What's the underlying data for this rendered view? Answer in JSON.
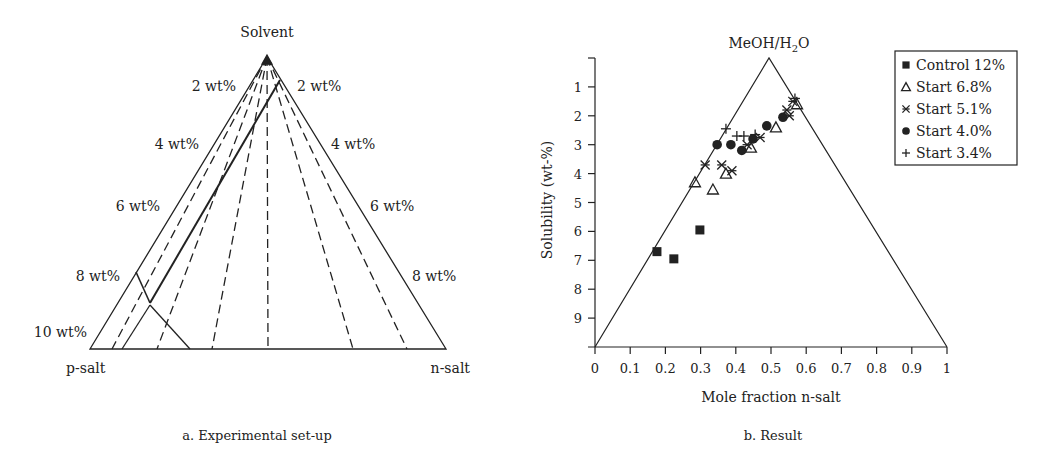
{
  "panel_a": {
    "caption": "a. Experimental set-up",
    "apex_label": "Solvent",
    "left_corner_label": "p-salt",
    "right_corner_label": "n-salt",
    "left_scale_labels": [
      "2 wt%",
      "4 wt%",
      "6 wt%",
      "8 wt%",
      "10 wt%"
    ],
    "right_scale_labels": [
      "2 wt%",
      "4 wt%",
      "6 wt%",
      "8 wt%"
    ]
  },
  "panel_b": {
    "caption": "b. Result",
    "apex_label": "MeOH/H",
    "apex_label_sub": "2",
    "apex_label_tail": "O",
    "xlabel": "Mole fraction n-salt",
    "ylabel": "Solubility (wt-%)",
    "x_ticks": [
      "0",
      "0.1",
      "0.2",
      "0.3",
      "0.4",
      "0.5",
      "0.6",
      "0.7",
      "0.8",
      "0.9",
      "1"
    ],
    "y_ticks": [
      "1",
      "2",
      "3",
      "4",
      "5",
      "6",
      "7",
      "8",
      "9"
    ],
    "legend": [
      {
        "marker": "square",
        "label": "Control 12%"
      },
      {
        "marker": "triangle-open",
        "label": "Start 6.8%"
      },
      {
        "marker": "asterisk",
        "label": "Start 5.1%"
      },
      {
        "marker": "circle",
        "label": "Start 4.0%"
      },
      {
        "marker": "plus",
        "label": "Start 3.4%"
      }
    ]
  },
  "chart_data": [
    {
      "type": "diagram",
      "title": "a. Experimental set-up",
      "description": "Ternary diagram Solvent / p-salt / n-salt with dashed tie lines from Solvent apex and solid operating path",
      "vertices": [
        "Solvent",
        "p-salt",
        "n-salt"
      ],
      "scale_labels_left": [
        "2 wt%",
        "4 wt%",
        "6 wt%",
        "8 wt%",
        "10 wt%"
      ],
      "scale_labels_right": [
        "2 wt%",
        "4 wt%",
        "6 wt%",
        "8 wt%"
      ]
    },
    {
      "type": "scatter",
      "title": "b. Result",
      "xlabel": "Mole fraction n-salt",
      "ylabel": "Solubility (wt-%)",
      "xlim": [
        0,
        1
      ],
      "ylim": [
        10,
        0
      ],
      "y_inverted": true,
      "apex_label": "MeOH/H2O",
      "legend_position": "top-right",
      "grid": false,
      "series": [
        {
          "name": "Control 12%",
          "marker": "square",
          "points": [
            [
              0.176,
              6.7
            ],
            [
              0.224,
              6.95
            ],
            [
              0.298,
              5.95
            ]
          ]
        },
        {
          "name": "Start 6.8%",
          "marker": "triangle-open",
          "points": [
            [
              0.284,
              4.3
            ],
            [
              0.335,
              4.55
            ],
            [
              0.372,
              4.0
            ],
            [
              0.443,
              3.1
            ],
            [
              0.514,
              2.4
            ],
            [
              0.574,
              1.6
            ]
          ]
        },
        {
          "name": "Start 5.1%",
          "marker": "asterisk",
          "points": [
            [
              0.313,
              3.7
            ],
            [
              0.36,
              3.7
            ],
            [
              0.389,
              3.9
            ],
            [
              0.432,
              3.0
            ],
            [
              0.469,
              2.75
            ],
            [
              0.545,
              1.8
            ],
            [
              0.552,
              2.0
            ],
            [
              0.562,
              1.5
            ]
          ]
        },
        {
          "name": "Start 4.0%",
          "marker": "circle",
          "points": [
            [
              0.347,
              3.0
            ],
            [
              0.386,
              3.0
            ],
            [
              0.417,
              3.2
            ],
            [
              0.449,
              2.8
            ],
            [
              0.488,
              2.35
            ],
            [
              0.534,
              2.05
            ]
          ]
        },
        {
          "name": "Start 3.4%",
          "marker": "plus",
          "points": [
            [
              0.372,
              2.45
            ],
            [
              0.403,
              2.7
            ],
            [
              0.423,
              2.7
            ],
            [
              0.455,
              2.65
            ],
            [
              0.568,
              1.4
            ]
          ]
        }
      ]
    }
  ]
}
